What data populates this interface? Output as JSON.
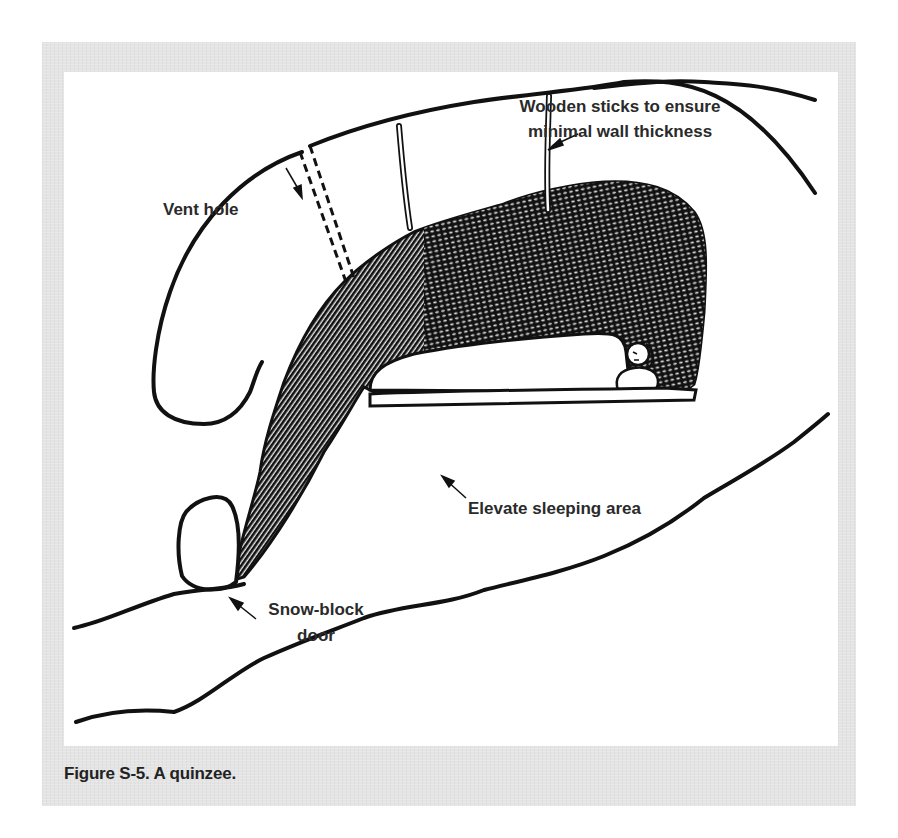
{
  "figure": {
    "caption": "Figure S-5. A quinzee.",
    "frame_color": "#e4e4e4",
    "panel_color": "#ffffff",
    "ink_color": "#111111"
  },
  "labels": {
    "sticks_line1": "Wooden sticks to ensure",
    "sticks_line2": "minimal wall thickness",
    "vent_hole": "Vent hole",
    "sleeping_area": "Elevate sleeping area",
    "door_line1": "Snow-block",
    "door_line2": "door"
  },
  "illustration": {
    "subject": "quinzee snow shelter cross-section",
    "parts": [
      "outer snow dome",
      "vent hole",
      "wooden sticks",
      "hollowed interior",
      "raised sleeping platform",
      "sleeping person",
      "snow-block door",
      "ground"
    ]
  }
}
